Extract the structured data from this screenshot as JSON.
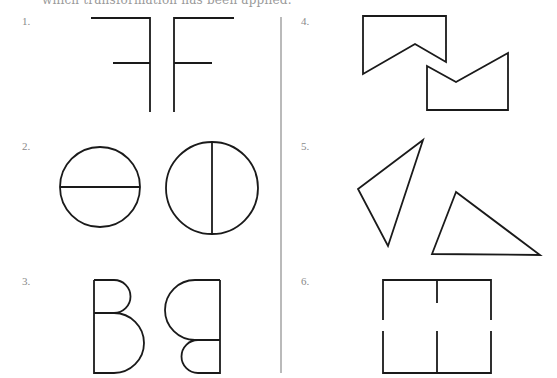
{
  "header": {
    "cut_off_text": "which transformation has been applied."
  },
  "exercises": [
    {
      "number": "1.",
      "label": "1.",
      "description": "mirrored F shapes (reflection)"
    },
    {
      "number": "2.",
      "label": "2.",
      "description": "circles with horizontal and vertical diameters"
    },
    {
      "number": "3.",
      "label": "3.",
      "description": "B shape and its rotated image"
    },
    {
      "number": "4.",
      "label": "4.",
      "description": "notched pentagons"
    },
    {
      "number": "5.",
      "label": "5.",
      "description": "two triangles"
    },
    {
      "number": "6.",
      "label": "6.",
      "description": "rectangle split into upper and lower halves"
    }
  ],
  "colors": {
    "stroke": "#1a1a1a",
    "label": "#8a8a8a",
    "divider": "#8c8c8c",
    "background": "#ffffff"
  }
}
